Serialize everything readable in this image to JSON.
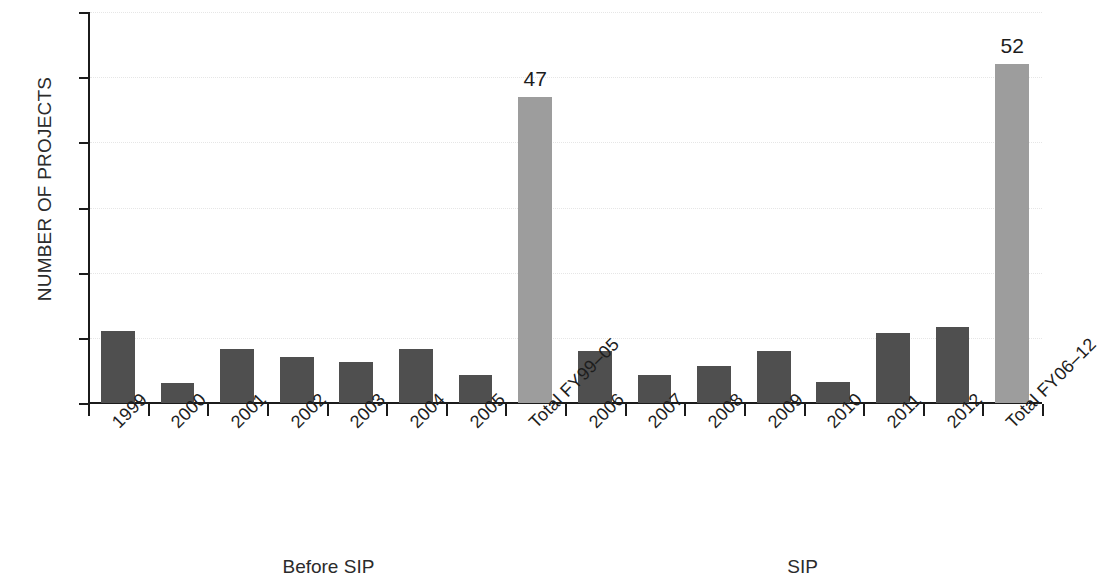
{
  "chart_data": {
    "type": "bar",
    "title": "",
    "subtitle": "",
    "xlabel": "",
    "ylabel": "NUMBER OF PROJECTS",
    "ylim": [
      0,
      60
    ],
    "ytick_step": 10,
    "yticks": [
      "0",
      "10",
      "20",
      "30",
      "40",
      "50",
      "60"
    ],
    "grid": true,
    "grid_style": "dotted-horizontal-light",
    "legend": null,
    "categories": [
      "1999",
      "2000",
      "2001",
      "2002",
      "2003",
      "2004",
      "2005",
      "Total FY99–05",
      "2006",
      "2007",
      "2008",
      "2009",
      "2010",
      "2011",
      "2012",
      "Total FY06–12"
    ],
    "values": [
      11,
      3,
      8.3,
      7,
      6.3,
      8.3,
      4.3,
      47,
      8,
      4.3,
      5.7,
      8,
      3.2,
      10.8,
      11.7,
      52
    ],
    "bar_kinds": [
      "annual",
      "annual",
      "annual",
      "annual",
      "annual",
      "annual",
      "annual",
      "total",
      "annual",
      "annual",
      "annual",
      "annual",
      "annual",
      "annual",
      "annual",
      "total"
    ],
    "data_labels": [
      "",
      "",
      "",
      "",
      "",
      "",
      "",
      "47",
      "",
      "",
      "",
      "",
      "",
      "",
      "",
      "52"
    ],
    "group_labels": [
      {
        "text": "Before SIP",
        "center_fraction": 0.252
      },
      {
        "text": "SIP",
        "center_fraction": 0.749
      }
    ],
    "colors": {
      "bar_annual": "#4f4f4f",
      "bar_total": "#9d9d9d",
      "axis": "#1b1b1b",
      "grid": "#e6e6e6",
      "text": "#1d1d1d",
      "background": "#ffffff"
    }
  }
}
